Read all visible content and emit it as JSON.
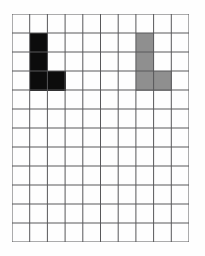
{
  "figure": {
    "type": "grid-puzzle",
    "background_color": "#fefefe"
  },
  "grid": {
    "columns": 10,
    "rows": 12,
    "line_color": "#58585a",
    "line_width_px": 1,
    "cell_background": "#fbfbfa",
    "origin_x_px": 12,
    "origin_y_px": 14,
    "width_px": 177,
    "height_px": 228,
    "cell_width_px": 17.7,
    "cell_height_px": 19.0
  },
  "shapes": [
    {
      "name": "black-l-piece",
      "label": "L",
      "color": "#0c0c0c",
      "cells": [
        {
          "col": 1,
          "row": 1
        },
        {
          "col": 1,
          "row": 2
        },
        {
          "col": 1,
          "row": 3
        },
        {
          "col": 2,
          "row": 3
        }
      ]
    },
    {
      "name": "gray-l-piece",
      "label": "L",
      "color": "#8f8f8f",
      "cells": [
        {
          "col": 7,
          "row": 1
        },
        {
          "col": 7,
          "row": 2
        },
        {
          "col": 7,
          "row": 3
        },
        {
          "col": 8,
          "row": 3
        }
      ]
    }
  ]
}
